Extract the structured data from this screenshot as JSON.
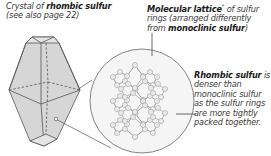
{
  "labels": {
    "crystal": {
      "prefix": "Crystal of ",
      "bold": "rhombic sulfur",
      "line2": "(see also page 22)"
    },
    "lattice": {
      "bold1": "Molecular lattice",
      "asterisk": "*",
      "text1": " of sulfur rings (arranged differently from ",
      "bold2": "monoclinic sulfur",
      "text2": ")"
    },
    "rhombic": {
      "bold": "Rhombic sulfur",
      "text": " is denser than monoclinic sulfur as the sulfur rings are more tightly packed together."
    }
  },
  "colors": {
    "crystal_fill": "#d9d9d9",
    "stroke": "#555555",
    "circle_fill": "#f4f4f4",
    "atom_fill": "#e6e6e6"
  }
}
